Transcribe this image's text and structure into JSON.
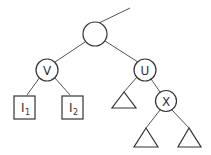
{
  "diagram": {
    "type": "tree",
    "root": {
      "label": ""
    },
    "nodes": [
      {
        "id": "root",
        "label": "",
        "shape": "circle"
      },
      {
        "id": "V",
        "label": "V",
        "shape": "circle"
      },
      {
        "id": "U",
        "label": "U",
        "shape": "circle"
      },
      {
        "id": "X",
        "label": "X",
        "shape": "circle"
      },
      {
        "id": "I1",
        "label": "I",
        "subscript": "1",
        "shape": "square"
      },
      {
        "id": "I2",
        "label": "I",
        "subscript": "2",
        "shape": "square"
      },
      {
        "id": "T1",
        "label": "",
        "shape": "triangle"
      },
      {
        "id": "T2",
        "label": "",
        "shape": "triangle"
      },
      {
        "id": "T3",
        "label": "",
        "shape": "triangle"
      }
    ],
    "edges": [
      [
        "parent",
        "root"
      ],
      [
        "root",
        "V"
      ],
      [
        "root",
        "U"
      ],
      [
        "V",
        "I1"
      ],
      [
        "V",
        "I2"
      ],
      [
        "U",
        "T1"
      ],
      [
        "U",
        "X"
      ],
      [
        "X",
        "T2"
      ],
      [
        "X",
        "T3"
      ]
    ],
    "labels": {
      "v": "V",
      "u": "U",
      "x": "X",
      "i1_main": "I",
      "i1_sub": "1",
      "i2_main": "I",
      "i2_sub": "2"
    }
  }
}
